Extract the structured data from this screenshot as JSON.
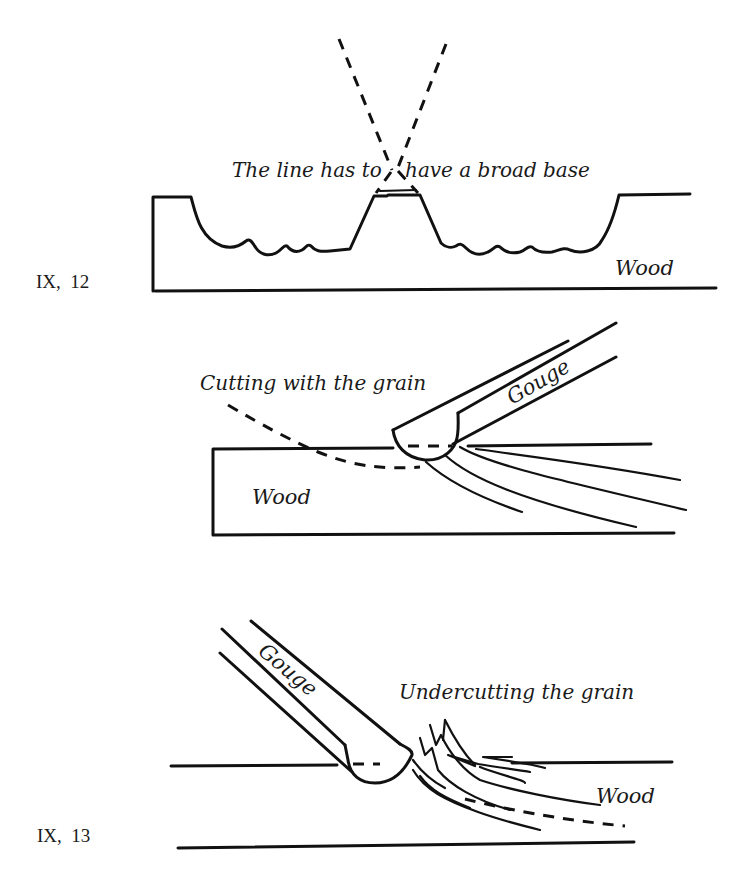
{
  "figures": [
    {
      "id": "IX, 12",
      "label": "IX,  12",
      "annotations": {
        "caption": "The line has to have a broad base",
        "caption_left": "The line has to",
        "caption_right": "have a broad base",
        "material": "Wood"
      }
    },
    {
      "id": "IX, 12b",
      "annotations": {
        "caption": "Cutting with the grain",
        "tool": "Gouge",
        "material": "Wood"
      }
    },
    {
      "id": "IX, 13",
      "label": "IX,  13",
      "annotations": {
        "caption": "Undercutting the grain",
        "tool": "Gouge",
        "material": "Wood"
      }
    }
  ],
  "colors": {
    "ink": "#111111",
    "paper": "#ffffff"
  }
}
